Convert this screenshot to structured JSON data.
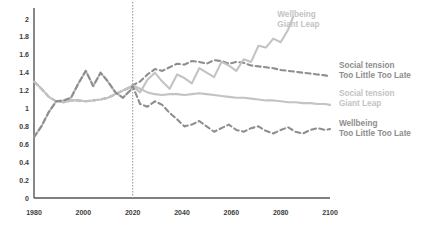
{
  "chart_data": {
    "type": "line",
    "title": "",
    "subtitle": "",
    "xlabel": "",
    "ylabel": "",
    "xlim": [
      1980,
      2100
    ],
    "ylim": [
      0,
      2.1
    ],
    "grid": false,
    "legend_position": "right-inline",
    "x_ticks": [
      "1980",
      "2000",
      "2020",
      "2040",
      "2060",
      "2080",
      "2100"
    ],
    "x_tick_values": [
      1980,
      2000,
      2020,
      2040,
      2060,
      2080,
      2100
    ],
    "y_ticks": [
      "0",
      "0.2",
      "0.4",
      "0.6",
      "0.8",
      "1",
      "1.2",
      "1.4",
      "1.6",
      "1.8",
      "2"
    ],
    "y_tick_values": [
      0,
      0.2,
      0.4,
      0.6,
      0.8,
      1,
      1.2,
      1.4,
      1.6,
      1.8,
      2
    ],
    "annotations": [
      {
        "name": "present-day-divider",
        "type": "vline",
        "x": 2020,
        "style": "dotted",
        "color": "#9a9a9a"
      }
    ],
    "series": [
      {
        "name": "Social tension Too Little Too Late",
        "label_line1": "Social tension",
        "label_line2": "Too Little Too Late",
        "color": "#8e8e8e",
        "style": "dashed",
        "label_x": 2102,
        "label_y": 1.45,
        "x": [
          1980,
          1983,
          1986,
          1989,
          1992,
          1995,
          1998,
          2001,
          2004,
          2007,
          2010,
          2013,
          2016,
          2019,
          2020,
          2023,
          2026,
          2029,
          2032,
          2035,
          2038,
          2041,
          2044,
          2047,
          2050,
          2053,
          2056,
          2059,
          2062,
          2065,
          2068,
          2071,
          2074,
          2077,
          2080,
          2083,
          2086,
          2089,
          2092,
          2095,
          2098,
          2100
        ],
        "values": [
          1.3,
          1.22,
          1.13,
          1.08,
          1.07,
          1.09,
          1.09,
          1.08,
          1.09,
          1.1,
          1.12,
          1.16,
          1.2,
          1.24,
          1.26,
          1.3,
          1.38,
          1.44,
          1.42,
          1.46,
          1.5,
          1.49,
          1.53,
          1.52,
          1.5,
          1.54,
          1.53,
          1.5,
          1.52,
          1.51,
          1.48,
          1.47,
          1.46,
          1.45,
          1.43,
          1.42,
          1.41,
          1.4,
          1.39,
          1.38,
          1.37,
          1.36
        ]
      },
      {
        "name": "Social tension Giant Leap",
        "label_line1": "Social tension",
        "label_line2": "Giant Leap",
        "color": "#c3c3c3",
        "style": "solid",
        "label_x": 2102,
        "label_y": 1.14,
        "x": [
          1980,
          1983,
          1986,
          1989,
          1992,
          1995,
          1998,
          2001,
          2004,
          2007,
          2010,
          2013,
          2016,
          2019,
          2020,
          2023,
          2026,
          2029,
          2032,
          2035,
          2038,
          2041,
          2044,
          2047,
          2050,
          2053,
          2056,
          2059,
          2062,
          2065,
          2068,
          2071,
          2074,
          2077,
          2080,
          2083,
          2086,
          2089,
          2092,
          2095,
          2098,
          2100
        ],
        "values": [
          1.3,
          1.22,
          1.13,
          1.08,
          1.07,
          1.09,
          1.09,
          1.08,
          1.09,
          1.1,
          1.12,
          1.16,
          1.2,
          1.24,
          1.26,
          1.22,
          1.18,
          1.16,
          1.15,
          1.16,
          1.16,
          1.15,
          1.16,
          1.17,
          1.16,
          1.15,
          1.14,
          1.13,
          1.12,
          1.12,
          1.11,
          1.1,
          1.09,
          1.09,
          1.08,
          1.07,
          1.07,
          1.06,
          1.06,
          1.05,
          1.05,
          1.04
        ]
      },
      {
        "name": "Wellbeing Giant Leap",
        "label_line1": "Wellbeing",
        "label_line2": "Giant Leap",
        "color": "#c3c3c3",
        "style": "solid",
        "label_x": 2077,
        "label_y": 2.02,
        "x": [
          1980,
          1983,
          1986,
          1989,
          1992,
          1995,
          1998,
          2001,
          2004,
          2007,
          2010,
          2013,
          2016,
          2019,
          2020,
          2023,
          2026,
          2029,
          2032,
          2035,
          2038,
          2041,
          2044,
          2047,
          2050,
          2053,
          2056,
          2059,
          2062,
          2065,
          2068,
          2071,
          2074,
          2077,
          2080,
          2083,
          2085
        ],
        "values": [
          0.68,
          0.8,
          0.96,
          1.08,
          1.09,
          1.12,
          1.28,
          1.42,
          1.25,
          1.4,
          1.3,
          1.18,
          1.12,
          1.2,
          1.25,
          1.18,
          1.32,
          1.4,
          1.3,
          1.22,
          1.38,
          1.34,
          1.28,
          1.45,
          1.4,
          1.35,
          1.52,
          1.48,
          1.42,
          1.55,
          1.52,
          1.7,
          1.68,
          1.78,
          1.74,
          1.88,
          2.02
        ]
      },
      {
        "name": "Wellbeing Too Little Too Late",
        "label_line1": "Wellbeing",
        "label_line2": "Too Little Too Late",
        "color": "#8e8e8e",
        "style": "dashed",
        "label_x": 2102,
        "label_y": 0.8,
        "x": [
          1980,
          1983,
          1986,
          1989,
          1992,
          1995,
          1998,
          2001,
          2004,
          2007,
          2010,
          2013,
          2016,
          2019,
          2020,
          2023,
          2026,
          2029,
          2032,
          2035,
          2038,
          2041,
          2044,
          2047,
          2050,
          2053,
          2056,
          2059,
          2062,
          2065,
          2068,
          2071,
          2074,
          2077,
          2080,
          2083,
          2086,
          2089,
          2092,
          2095,
          2098,
          2100
        ],
        "values": [
          0.68,
          0.8,
          0.96,
          1.08,
          1.09,
          1.12,
          1.28,
          1.42,
          1.25,
          1.4,
          1.3,
          1.18,
          1.12,
          1.2,
          1.25,
          1.05,
          1.02,
          1.08,
          1.04,
          0.95,
          0.88,
          0.8,
          0.82,
          0.86,
          0.8,
          0.74,
          0.78,
          0.82,
          0.76,
          0.74,
          0.78,
          0.8,
          0.75,
          0.72,
          0.76,
          0.79,
          0.74,
          0.72,
          0.76,
          0.78,
          0.76,
          0.77
        ]
      }
    ]
  },
  "axis": {
    "axis_color": "#555555",
    "tick_color": "#3c3c3c"
  }
}
